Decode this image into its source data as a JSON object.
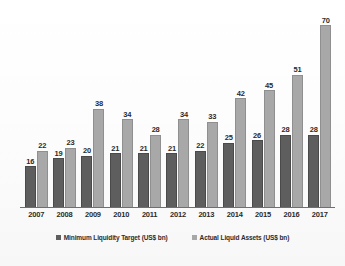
{
  "chart_data": {
    "type": "bar",
    "title": "",
    "xlabel": "",
    "ylabel": "",
    "ylim": [
      0,
      75
    ],
    "grid": false,
    "legend_position": "bottom-center",
    "categories": [
      "2007",
      "2008",
      "2009",
      "2010",
      "2011",
      "2012",
      "2013",
      "2014",
      "2015",
      "2016",
      "2017"
    ],
    "series": [
      {
        "name": "Minimum Liquidity Target (US$ bn)",
        "color": "#5e5e5e",
        "values": [
          16,
          19,
          20,
          21,
          21,
          21,
          22,
          25,
          26,
          28,
          28
        ]
      },
      {
        "name": "Actual Liquid Assets (US$ bn)",
        "color": "#a8a8a8",
        "values": [
          22,
          23,
          38,
          34,
          28,
          34,
          33,
          42,
          45,
          51,
          70
        ]
      }
    ]
  },
  "legend": {
    "items": [
      {
        "label": "Minimum Liquidity Target (US$ bn)",
        "marker": "square-dark-icon"
      },
      {
        "label": "Actual Liquid Assets (US$ bn)",
        "marker": "square-light-icon"
      }
    ]
  }
}
